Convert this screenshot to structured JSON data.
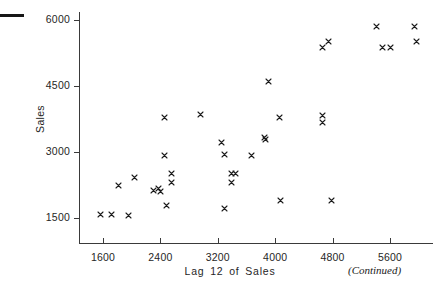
{
  "figure": {
    "top_rule": "horizontal-rule-mark",
    "continued_note": "(Continued)"
  },
  "chart_data": {
    "type": "scatter",
    "title": "",
    "xlabel": "Lag 12 of Sales",
    "ylabel": "Sales",
    "xlim": [
      1300,
      6200
    ],
    "ylim": [
      900,
      6300
    ],
    "xticks": [
      1600,
      2400,
      3200,
      4000,
      4800,
      5600
    ],
    "xtick_labels": [
      "1600",
      "2400",
      "3200",
      "4000",
      "4800",
      "5600"
    ],
    "yticks": [
      1500,
      3000,
      4500,
      6000
    ],
    "ytick_labels": [
      "1500",
      "3000",
      "4500",
      "6000"
    ],
    "grid": false,
    "legend": null,
    "marker": "x",
    "marker_color": "#1c1c1c",
    "points": [
      {
        "x": 1560,
        "y": 1580
      },
      {
        "x": 1715,
        "y": 1580
      },
      {
        "x": 1950,
        "y": 1565
      },
      {
        "x": 1810,
        "y": 2230
      },
      {
        "x": 2040,
        "y": 2420
      },
      {
        "x": 2300,
        "y": 2120
      },
      {
        "x": 2370,
        "y": 2160
      },
      {
        "x": 2395,
        "y": 2095
      },
      {
        "x": 2455,
        "y": 3795
      },
      {
        "x": 2460,
        "y": 2925
      },
      {
        "x": 2555,
        "y": 2505
      },
      {
        "x": 2560,
        "y": 2310
      },
      {
        "x": 2490,
        "y": 1790
      },
      {
        "x": 2955,
        "y": 3855
      },
      {
        "x": 3250,
        "y": 3215
      },
      {
        "x": 3300,
        "y": 2940
      },
      {
        "x": 3395,
        "y": 2510
      },
      {
        "x": 3450,
        "y": 2510
      },
      {
        "x": 3390,
        "y": 2305
      },
      {
        "x": 3290,
        "y": 1715
      },
      {
        "x": 3665,
        "y": 2925
      },
      {
        "x": 3855,
        "y": 3335
      },
      {
        "x": 3865,
        "y": 3275
      },
      {
        "x": 3900,
        "y": 4595
      },
      {
        "x": 4060,
        "y": 3795
      },
      {
        "x": 4075,
        "y": 1900
      },
      {
        "x": 4665,
        "y": 3820
      },
      {
        "x": 4665,
        "y": 3670
      },
      {
        "x": 4660,
        "y": 5375
      },
      {
        "x": 4745,
        "y": 5520
      },
      {
        "x": 4785,
        "y": 1900
      },
      {
        "x": 5405,
        "y": 5855
      },
      {
        "x": 5490,
        "y": 5375
      },
      {
        "x": 5600,
        "y": 5375
      },
      {
        "x": 5935,
        "y": 5860
      },
      {
        "x": 5970,
        "y": 5515
      }
    ]
  }
}
